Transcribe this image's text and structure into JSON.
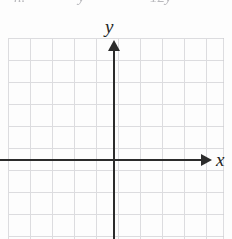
{
  "figure": {
    "kind": "blank-cartesian-coordinate-grid",
    "background_color": "#fdfdfd",
    "grid_color": "#c9c9ce",
    "axis_color": "#2b2b2b",
    "label_color": "#242424"
  },
  "axes": {
    "y_label": "y",
    "x_label": "x",
    "y_arrow_direction": "up",
    "x_arrow_direction": "right"
  },
  "grid": {
    "cell_size_px": 22,
    "columns": 10,
    "rows": 9,
    "origin_x_px": 114,
    "origin_y_px": 160
  },
  "top_cutoff_text": {
    "fragment_1": "n.",
    "fragment_2": "y",
    "fragment_3": "12y"
  },
  "chart_data": {
    "type": "scatter",
    "title": "",
    "subtitle": "",
    "xlabel": "x",
    "ylabel": "y",
    "series": [
      {
        "name": "",
        "x": [],
        "y": []
      }
    ],
    "xlim": [
      -5,
      5
    ],
    "ylim": [
      -4,
      5
    ],
    "xticks": [
      -5,
      -4,
      -3,
      -2,
      -1,
      0,
      1,
      2,
      3,
      4,
      5
    ],
    "yticks": [
      -4,
      -3,
      -2,
      -1,
      0,
      1,
      2,
      3,
      4,
      5
    ],
    "xtick_labels": [
      "",
      "",
      "",
      "",
      "",
      "",
      "",
      "",
      "",
      "",
      ""
    ],
    "ytick_labels": [
      "",
      "",
      "",
      "",
      "",
      "",
      "",
      "",
      "",
      ""
    ],
    "grid": true,
    "legend": false,
    "annotations": []
  }
}
